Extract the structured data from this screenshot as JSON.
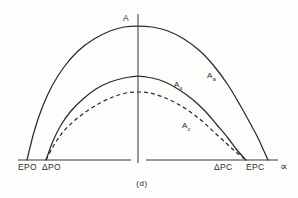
{
  "figure": {
    "caption": "(d)",
    "y_axis_label": "A",
    "x_axis_label": "∝"
  },
  "axis_ticks": {
    "left_outer": "EPO",
    "left_inner": "ΔPO",
    "right_inner": "ΔPC",
    "right_outer": "EPC"
  },
  "curve_labels": {
    "outer": {
      "base": "A",
      "sub": "a"
    },
    "middle": {
      "base": "A",
      "sub": "s"
    },
    "dashed": {
      "base": "A",
      "sub": "c"
    }
  },
  "colors": {
    "ink": "#2b2b2b",
    "axis": "#3a3a3a",
    "background": "#fdfdfc"
  },
  "chart_data": {
    "type": "line",
    "title": "",
    "subtitle": "",
    "xlabel": "∝",
    "ylabel": "A",
    "grid": false,
    "legend_position": "inline-annotation",
    "xlim": [
      0,
      298
    ],
    "ylim": [
      0,
      160
    ],
    "baseline_y": 160,
    "vertical_axis_x": 138,
    "annotations": [
      {
        "text": "(d)",
        "role": "figure-caption",
        "x": 142,
        "y": 183
      },
      {
        "text": "A",
        "role": "y-axis-title",
        "x": 131,
        "y": 20
      },
      {
        "text": "∝",
        "role": "x-axis-title",
        "x": 281,
        "y": 168
      }
    ],
    "x_tick_positions": [
      27,
      46,
      246,
      268
    ],
    "x_tick_labels": [
      "EPO",
      "ΔPO",
      "ΔPC",
      "EPC"
    ],
    "series": [
      {
        "name": "Aa",
        "label": "A",
        "sublabel": "a",
        "style": "solid",
        "comment": "outer widest and tallest parabola-like curve",
        "x_start": 27,
        "x_end": 268,
        "peak_x": 138,
        "peak_y": 26,
        "points": [
          [
            27,
            160
          ],
          [
            34,
            132
          ],
          [
            42,
            108
          ],
          [
            52,
            86
          ],
          [
            64,
            67
          ],
          [
            78,
            51
          ],
          [
            94,
            39
          ],
          [
            110,
            31
          ],
          [
            124,
            27
          ],
          [
            138,
            26
          ],
          [
            152,
            27
          ],
          [
            168,
            31
          ],
          [
            184,
            39
          ],
          [
            200,
            51
          ],
          [
            214,
            66
          ],
          [
            228,
            85
          ],
          [
            240,
            105
          ],
          [
            250,
            123
          ],
          [
            258,
            138
          ],
          [
            263,
            149
          ],
          [
            268,
            160
          ]
        ]
      },
      {
        "name": "As",
        "label": "A",
        "sublabel": "s",
        "style": "solid",
        "comment": "middle solid curve, narrower and lower",
        "x_start": 46,
        "x_end": 246,
        "peak_x": 138,
        "peak_y": 76,
        "points": [
          [
            46,
            160
          ],
          [
            53,
            141
          ],
          [
            61,
            125
          ],
          [
            71,
            111
          ],
          [
            83,
            99
          ],
          [
            96,
            89
          ],
          [
            110,
            82
          ],
          [
            124,
            78
          ],
          [
            138,
            76
          ],
          [
            152,
            78
          ],
          [
            165,
            82
          ],
          [
            178,
            89
          ],
          [
            192,
            99
          ],
          [
            205,
            111
          ],
          [
            217,
            125
          ],
          [
            228,
            138
          ],
          [
            237,
            150
          ],
          [
            246,
            160
          ]
        ]
      },
      {
        "name": "Ac",
        "label": "A",
        "sublabel": "c",
        "style": "dashed",
        "comment": "lowest dashed curve",
        "x_start": 46,
        "x_end": 246,
        "peak_x": 138,
        "peak_y": 92,
        "points": [
          [
            46,
            160
          ],
          [
            54,
            145
          ],
          [
            63,
            132
          ],
          [
            74,
            121
          ],
          [
            87,
            111
          ],
          [
            100,
            103
          ],
          [
            113,
            97
          ],
          [
            126,
            93
          ],
          [
            138,
            92
          ],
          [
            150,
            93
          ],
          [
            163,
            97
          ],
          [
            176,
            103
          ],
          [
            189,
            111
          ],
          [
            202,
            121
          ],
          [
            214,
            132
          ],
          [
            226,
            143
          ],
          [
            236,
            152
          ],
          [
            246,
            160
          ]
        ]
      }
    ]
  }
}
